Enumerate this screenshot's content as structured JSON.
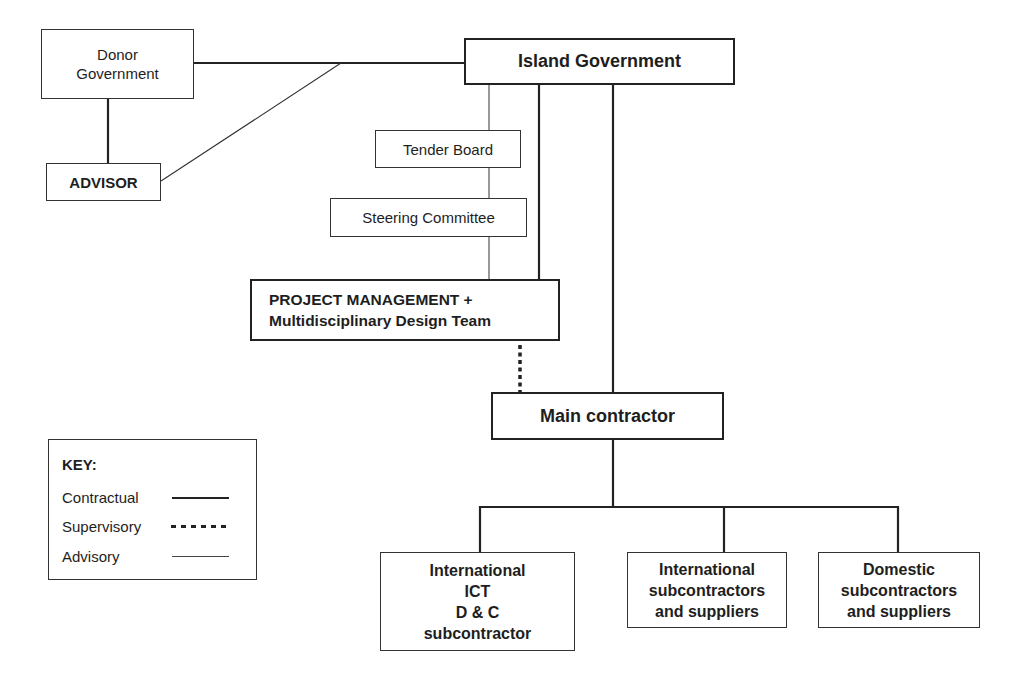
{
  "diagram": {
    "type": "organisation-chart",
    "nodes": {
      "donor_government": {
        "label": "Donor Government",
        "lines": [
          "Donor",
          "Government"
        ]
      },
      "advisor": {
        "label": "ADVISOR"
      },
      "island_government": {
        "label": "Island Government"
      },
      "tender_board": {
        "label": "Tender Board"
      },
      "steering_committee": {
        "label": "Steering Committee"
      },
      "project_management": {
        "lines": [
          "PROJECT MANAGEMENT +",
          "Multidisciplinary Design Team"
        ]
      },
      "main_contractor": {
        "label": "Main contractor"
      },
      "intl_ict": {
        "lines": [
          "International",
          "ICT",
          "D & C",
          "subcontractor"
        ]
      },
      "intl_subcontractors": {
        "lines": [
          "International",
          "subcontractors",
          "and suppliers"
        ]
      },
      "domestic_subcontractors": {
        "lines": [
          "Domestic",
          "subcontractors",
          "and suppliers"
        ]
      }
    },
    "edges": [
      {
        "from": "donor_government",
        "to": "island_government",
        "type": "contractual"
      },
      {
        "from": "donor_government",
        "to": "advisor",
        "type": "contractual"
      },
      {
        "from": "advisor",
        "to": "island_government",
        "type": "advisory"
      },
      {
        "from": "island_government",
        "to": "tender_board",
        "type": "advisory"
      },
      {
        "from": "tender_board",
        "to": "steering_committee",
        "type": "advisory"
      },
      {
        "from": "steering_committee",
        "to": "project_management",
        "type": "advisory"
      },
      {
        "from": "island_government",
        "to": "project_management",
        "type": "contractual"
      },
      {
        "from": "island_government",
        "to": "main_contractor",
        "type": "contractual"
      },
      {
        "from": "project_management",
        "to": "main_contractor",
        "type": "supervisory"
      },
      {
        "from": "main_contractor",
        "to": "intl_ict",
        "type": "contractual"
      },
      {
        "from": "main_contractor",
        "to": "intl_subcontractors",
        "type": "contractual"
      },
      {
        "from": "main_contractor",
        "to": "domestic_subcontractors",
        "type": "contractual"
      }
    ]
  },
  "key": {
    "title": "KEY:",
    "items": [
      {
        "label": "Contractual",
        "style": "solid-thick"
      },
      {
        "label": "Supervisory",
        "style": "dotted"
      },
      {
        "label": "Advisory",
        "style": "solid-thin"
      }
    ]
  }
}
